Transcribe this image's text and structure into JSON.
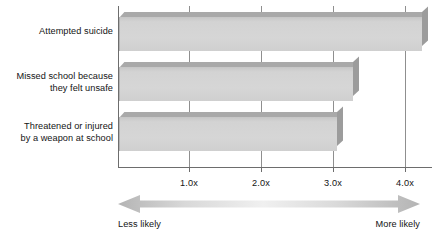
{
  "chart_data": {
    "type": "bar",
    "orientation": "horizontal",
    "title": "",
    "subtitle": "",
    "xlabel": "",
    "ylabel": "",
    "categories": [
      "Attempted suicide",
      "Missed school because\nthey felt unsafe",
      "Threatened or injured\nby a weapon at school"
    ],
    "values": [
      4.23,
      3.27,
      3.05
    ],
    "unit_suffix": "x",
    "xlim": [
      0,
      4.39
    ],
    "xticks": [
      1.0,
      2.0,
      3.0,
      4.0
    ],
    "xticklabels": [
      "1.0x",
      "2.0x",
      "3.0x",
      "4.0x"
    ],
    "grid": true,
    "grid_axis": "x",
    "legend": "none",
    "annotations": [
      {
        "name": "less-likely",
        "text": "Less likely",
        "position": "bottom-left"
      },
      {
        "name": "more-likely",
        "text": "More likely",
        "position": "bottom-right"
      }
    ],
    "series": [
      {
        "name": "Relative likelihood",
        "values": [
          4.23,
          3.27,
          3.05
        ]
      }
    ]
  },
  "axis": {
    "ticks": [
      {
        "label": "1.0x",
        "value": 1.0
      },
      {
        "label": "2.0x",
        "value": 2.0
      },
      {
        "label": "3.0x",
        "value": 3.0
      },
      {
        "label": "4.0x",
        "value": 4.0
      }
    ]
  },
  "categories": [
    {
      "label": "Attempted suicide"
    },
    {
      "label": "Missed school because\nthey felt unsafe"
    },
    {
      "label": "Threatened or injured\nby a weapon at school"
    }
  ],
  "footer": {
    "less_likely": "Less likely",
    "more_likely": "More likely"
  },
  "colors": {
    "bar_face": "#d3d3d3",
    "bar_top": "#a9a9a9",
    "bar_side": "#9c9c9c",
    "axis": "#6d6d6d",
    "gridline": "#8f8f8f",
    "text": "#141414",
    "arrow": "#b8b8b8",
    "background": "#ffffff"
  }
}
